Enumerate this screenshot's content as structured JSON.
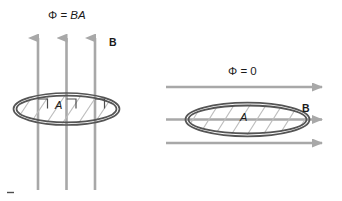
{
  "figure": {
    "colors": {
      "field_line": "#a8a8a8",
      "loop_outline": "#4d4d4d",
      "hatch": "#b3b3b3",
      "text": "#1a1a1a",
      "background": "#ffffff"
    }
  },
  "left_panel": {
    "flux_label": {
      "symbol": "Φ",
      "equals": "=",
      "value": "BA",
      "full": "Φ = BA"
    },
    "field_label": "B",
    "area_label": "A",
    "field_direction": "up",
    "field_line_count": 3,
    "loop_orientation": "perpendicular-to-field",
    "right_angle_marks": 3
  },
  "right_panel": {
    "flux_label": {
      "symbol": "Φ",
      "equals": "=",
      "value": "0",
      "full": "Φ = 0"
    },
    "field_label": "B",
    "area_label": "A",
    "field_direction": "right",
    "field_line_count": 3,
    "loop_orientation": "parallel-to-field",
    "right_angle_marks": 0
  }
}
